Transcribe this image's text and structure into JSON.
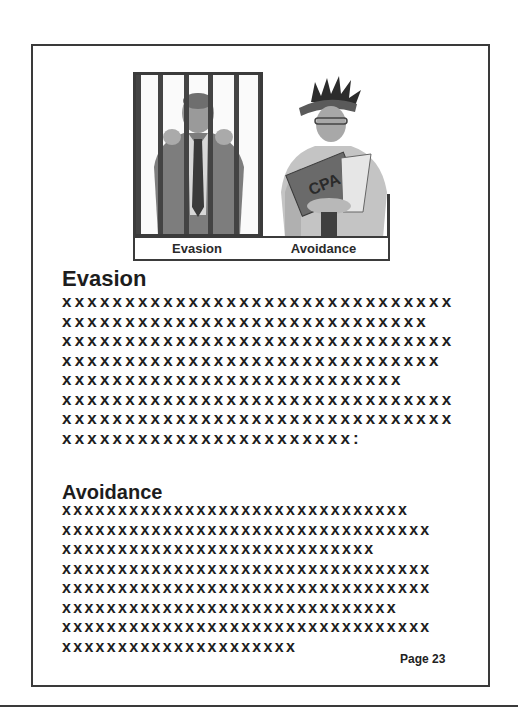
{
  "figure": {
    "captions": {
      "left": "Evasion",
      "right": "Avoidance"
    },
    "illustrations": {
      "left": "man-behind-bars",
      "right": "person-holding-book",
      "book_label": "CPA"
    }
  },
  "sections": [
    {
      "heading": "Evasion",
      "lines": [
        "xxxxxxxxxxxxxxxxxxxxxxxxxxxxxxx",
        "xxxxxxxxxxxxxxxxxxxxxxxxxxxxx",
        "xxxxxxxxxxxxxxxxxxxxxxxxxxxxxxx",
        "xxxxxxxxxxxxxxxxxxxxxxxxxxxxxx",
        "xxxxxxxxxxxxxxxxxxxxxxxxxxx",
        "xxxxxxxxxxxxxxxxxxxxxxxxxxxxxxx",
        "xxxxxxxxxxxxxxxxxxxxxxxxxxxxxxx",
        "xxxxxxxxxxxxxxxxxxxxxxx:"
      ]
    },
    {
      "heading": "Avoidance",
      "lines": [
        "xxxxxxxxxxxxxxxxxxxxxxxxxxxxxxx",
        "xxxxxxxxxxxxxxxxxxxxxxxxxxxxxxxxx",
        "xxxxxxxxxxxxxxxxxxxxxxxxxxxx",
        "xxxxxxxxxxxxxxxxxxxxxxxxxxxxxxxxx",
        "xxxxxxxxxxxxxxxxxxxxxxxxxxxxxxxxx",
        "xxxxxxxxxxxxxxxxxxxxxxxxxxxxxx",
        "xxxxxxxxxxxxxxxxxxxxxxxxxxxxxxxxx",
        "xxxxxxxxxxxxxxxxxxxxx"
      ]
    }
  ],
  "footer": {
    "page_label": "Page 23"
  }
}
